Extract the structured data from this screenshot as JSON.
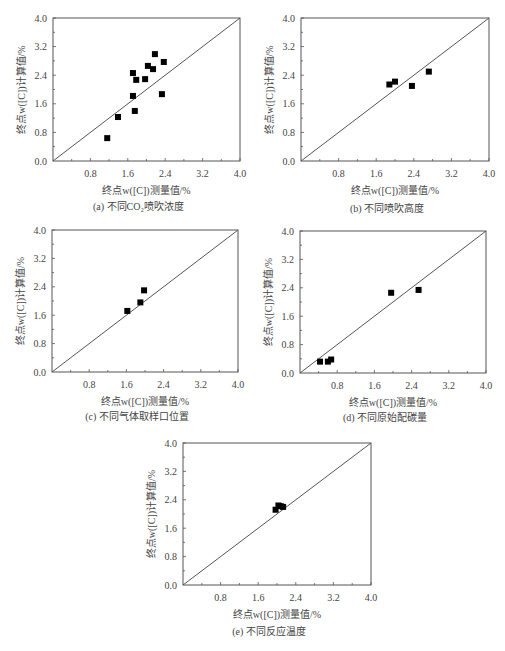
{
  "figure": {
    "panels": [
      {
        "id": "a",
        "caption": "(a) 不同CO₂喷吹浓度"
      },
      {
        "id": "b",
        "caption": "(b) 不同喷吹高度"
      },
      {
        "id": "c",
        "caption": "(c) 不同气体取样口位置"
      },
      {
        "id": "d",
        "caption": "(d) 不同原始配碳量"
      },
      {
        "id": "e",
        "caption": "(e) 不同反应温度"
      }
    ],
    "xlabel": "终点w([C])测量值/%",
    "ylabel": "终点w([C])计算值/%"
  },
  "chart_data": [
    {
      "type": "scatter",
      "title": "(a) 不同CO₂喷吹浓度",
      "xlabel": "终点w([C])测量值/%",
      "ylabel": "终点w([C])计算值/%",
      "xlim": [
        0,
        4.0
      ],
      "ylim": [
        0,
        4.0
      ],
      "xticks": [
        "0.8",
        "1.6",
        "2.4",
        "3.2",
        "4.0"
      ],
      "yticks": [
        "0.0",
        "0.8",
        "1.6",
        "2.4",
        "3.2",
        "4.0"
      ],
      "reference_line": "y = x",
      "grid": false,
      "marker": "filled-square",
      "x": [
        1.16,
        1.39,
        1.71,
        1.78,
        1.71,
        1.75,
        1.97,
        2.03,
        2.14,
        2.18,
        2.37,
        2.33
      ],
      "y": [
        0.64,
        1.23,
        2.46,
        2.27,
        1.82,
        1.4,
        2.29,
        2.66,
        2.57,
        2.99,
        2.77,
        1.87
      ]
    },
    {
      "type": "scatter",
      "title": "(b) 不同喷吹高度",
      "xlabel": "终点w([C])测量值/%",
      "ylabel": "终点w([C])计算值/%",
      "xlim": [
        0,
        4.0
      ],
      "ylim": [
        0,
        4.0
      ],
      "xticks": [
        "0.8",
        "1.6",
        "2.4",
        "3.2",
        "4.0"
      ],
      "yticks": [
        "0.0",
        "0.8",
        "1.6",
        "2.4",
        "3.2",
        "4.0"
      ],
      "reference_line": "y = x",
      "grid": false,
      "marker": "filled-square",
      "x": [
        1.88,
        2.0,
        2.36,
        2.72
      ],
      "y": [
        2.14,
        2.22,
        2.1,
        2.5
      ]
    },
    {
      "type": "scatter",
      "title": "(c) 不同气体取样口位置",
      "xlabel": "终点w([C])测量值/%",
      "ylabel": "终点w([C])计算值/%",
      "xlim": [
        0,
        4.0
      ],
      "ylim": [
        0,
        4.0
      ],
      "xticks": [
        "0.8",
        "1.6",
        "2.4",
        "3.2",
        "4.0"
      ],
      "yticks": [
        "0.0",
        "0.8",
        "1.6",
        "2.4",
        "3.2",
        "4.0"
      ],
      "reference_line": "y = x",
      "grid": false,
      "marker": "filled-square",
      "x": [
        1.62,
        1.9,
        1.98
      ],
      "y": [
        1.72,
        1.96,
        2.3
      ]
    },
    {
      "type": "scatter",
      "title": "(d) 不同原始配碳量",
      "xlabel": "终点w([C])测量值/%",
      "ylabel": "终点w([C])计算值/%",
      "xlim": [
        0,
        4.0
      ],
      "ylim": [
        0,
        4.0
      ],
      "xticks": [
        "0.8",
        "1.6",
        "2.4",
        "3.2",
        "4.0"
      ],
      "yticks": [
        "0.0",
        "0.8",
        "1.6",
        "2.4",
        "3.2",
        "4.0"
      ],
      "reference_line": "y = x",
      "grid": false,
      "marker": "filled-square",
      "x": [
        0.43,
        0.6,
        0.67,
        1.96,
        2.55
      ],
      "y": [
        0.32,
        0.32,
        0.38,
        2.26,
        2.34
      ]
    },
    {
      "type": "scatter",
      "title": "(e) 不同反应温度",
      "xlabel": "终点w([C])测量值/%",
      "ylabel": "终点w([C])计算值/%",
      "xlim": [
        0,
        4.0
      ],
      "ylim": [
        0,
        4.0
      ],
      "xticks": [
        "0.8",
        "1.6",
        "2.4",
        "3.2",
        "4.0"
      ],
      "yticks": [
        "0.0",
        "0.8",
        "1.6",
        "2.4",
        "3.2",
        "4.0"
      ],
      "reference_line": "y = x",
      "grid": false,
      "marker": "filled-square",
      "x": [
        1.97,
        2.03,
        2.08,
        2.13
      ],
      "y": [
        2.12,
        2.24,
        2.22,
        2.2
      ]
    }
  ],
  "layout": {
    "boxes": [
      {
        "x0": 53,
        "y0": 18,
        "x1": 240,
        "y1": 161,
        "cap_y": 210
      },
      {
        "x0": 301,
        "y0": 18,
        "x1": 489,
        "y1": 161,
        "cap_y": 212
      },
      {
        "x0": 52,
        "y0": 230,
        "x1": 238,
        "y1": 372,
        "cap_y": 420
      },
      {
        "x0": 300,
        "y0": 231,
        "x1": 486,
        "y1": 373,
        "cap_y": 421
      },
      {
        "x0": 183,
        "y0": 443,
        "x1": 371,
        "y1": 585,
        "cap_y": 635
      }
    ],
    "colors": {
      "axis": "#555555",
      "marker": "#000000",
      "text": "#444444",
      "line": "#555555"
    }
  }
}
